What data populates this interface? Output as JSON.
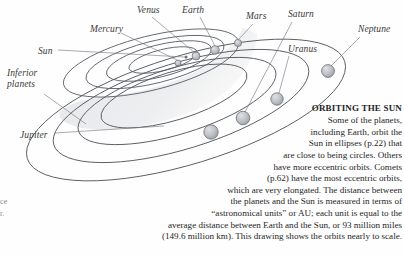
{
  "figure": {
    "kind": "solar-system-orbit-diagram",
    "colors": {
      "orbit_line": "#5a5e66",
      "orbit_line_faint": "#8d929b",
      "wedge_fill": "#e2e3e5",
      "planet_fill": "#b9bcc1",
      "planet_stroke": "#6b6f76",
      "leader_line": "#7a7d83",
      "text": "#1f1f1f",
      "label_text": "#3a3a3a"
    },
    "labels": [
      {
        "name": "sun",
        "text": "Sun",
        "x": 38,
        "y": 46,
        "multiline": false
      },
      {
        "name": "mercury",
        "text": "Mercury",
        "x": 90,
        "y": 24,
        "multiline": false
      },
      {
        "name": "venus",
        "text": "Venus",
        "x": 137,
        "y": 5,
        "multiline": false
      },
      {
        "name": "earth",
        "text": "Earth",
        "x": 182,
        "y": 5,
        "multiline": false
      },
      {
        "name": "mars",
        "text": "Mars",
        "x": 246,
        "y": 11,
        "multiline": false
      },
      {
        "name": "saturn",
        "text": "Saturn",
        "x": 288,
        "y": 9,
        "multiline": false
      },
      {
        "name": "uranus",
        "text": "Uranus",
        "x": 288,
        "y": 44,
        "multiline": false
      },
      {
        "name": "neptune",
        "text": "Neptune",
        "x": 358,
        "y": 24,
        "multiline": false
      },
      {
        "name": "jupiter",
        "text": "Jupiter",
        "x": 20,
        "y": 130,
        "multiline": false
      },
      {
        "name": "inferior-planets",
        "text": "Inferior planets",
        "x": 7,
        "y": 68,
        "multiline": true
      }
    ],
    "planets": [
      {
        "name": "mercury",
        "cx": 178,
        "cy": 63,
        "r": 3.0
      },
      {
        "name": "venus",
        "cx": 196,
        "cy": 56,
        "r": 4.0
      },
      {
        "name": "earth",
        "cx": 215,
        "cy": 50,
        "r": 4.3
      },
      {
        "name": "mars",
        "cx": 238,
        "cy": 43,
        "r": 3.6
      },
      {
        "name": "jupiter",
        "cx": 211,
        "cy": 132,
        "r": 7.2
      },
      {
        "name": "saturn",
        "cx": 243,
        "cy": 118,
        "r": 6.8
      },
      {
        "name": "uranus",
        "cx": 277,
        "cy": 99,
        "r": 6.2
      },
      {
        "name": "neptune",
        "cx": 328,
        "cy": 71,
        "r": 6.4
      }
    ]
  },
  "caption": {
    "heading": "ORBITING THE SUN",
    "lines": [
      "Some of the planets,",
      "including Earth, orbit the",
      "Sun in ellipses (p.22) that",
      "are close to being circles. Others",
      "have more eccentric orbits. Comets",
      "(p.62) have the most eccentric orbits,",
      "which are very elongated. The distance between",
      "the planets and the Sun is measured in terms of",
      "“astronomical units” or AU; each unit is equal to the",
      "average distance between Earth and the Sun, or 93 million miles",
      "(149.6 million km). This drawing shows the orbits nearly to scale."
    ]
  },
  "edge_fragment": {
    "line1": "ce",
    "line2": "r."
  }
}
